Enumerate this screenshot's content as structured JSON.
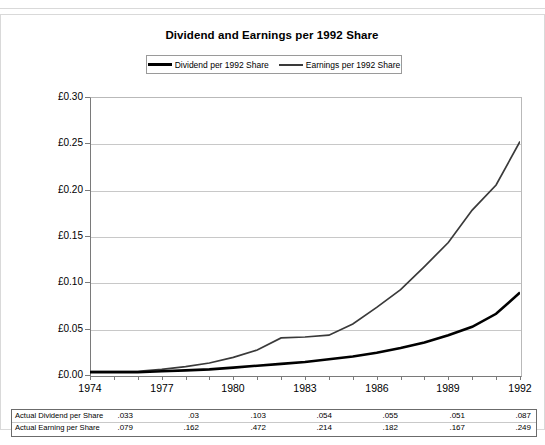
{
  "chart_data": {
    "type": "line",
    "title": "Dividend and Earnings per 1992 Share",
    "xlabel": "",
    "ylabel": "",
    "x": [
      1974,
      1975,
      1976,
      1977,
      1978,
      1979,
      1980,
      1981,
      1982,
      1983,
      1984,
      1985,
      1986,
      1987,
      1988,
      1989,
      1990,
      1991,
      1992
    ],
    "tick_labels": [
      "1974",
      "1977",
      "1980",
      "1983",
      "1986",
      "1989",
      "1992"
    ],
    "labeled_ticks": [
      1974,
      1977,
      1980,
      1983,
      1986,
      1989,
      1992
    ],
    "ylim": [
      0,
      0.3
    ],
    "ytick_values": [
      0.0,
      0.05,
      0.1,
      0.15,
      0.2,
      0.25,
      0.3
    ],
    "ytick_labels": [
      "£0.00",
      "£0.05",
      "£0.10",
      "£0.15",
      "£0.20",
      "£0.25",
      "£0.30"
    ],
    "grid": true,
    "legend_position": "top-center",
    "series": [
      {
        "name": "Dividend per 1992 Share",
        "color": "#000000",
        "width": 2.6,
        "values": [
          0.003,
          0.003,
          0.003,
          0.004,
          0.005,
          0.006,
          0.008,
          0.01,
          0.012,
          0.014,
          0.017,
          0.02,
          0.024,
          0.029,
          0.035,
          0.043,
          0.052,
          0.066,
          0.089
        ]
      },
      {
        "name": "Earnings per 1992 Share",
        "color": "#3a3a3a",
        "width": 1.7,
        "values": [
          0.004,
          0.004,
          0.004,
          0.006,
          0.009,
          0.013,
          0.019,
          0.027,
          0.04,
          0.041,
          0.043,
          0.055,
          0.073,
          0.092,
          0.117,
          0.143,
          0.178,
          0.205,
          0.252
        ]
      }
    ]
  },
  "legend": {
    "entries": [
      {
        "label": "Dividend per 1992 Share"
      },
      {
        "label": "Earnings per 1992 Share"
      }
    ]
  },
  "table": {
    "rows": [
      {
        "label": "Actual Dividend per Share",
        "values": [
          ".033",
          ".03",
          ".103",
          ".054",
          ".055",
          ".051",
          ".087"
        ]
      },
      {
        "label": "Actual Earning per Share",
        "values": [
          ".079",
          ".162",
          ".472",
          ".214",
          ".182",
          ".167",
          ".249"
        ]
      }
    ]
  }
}
